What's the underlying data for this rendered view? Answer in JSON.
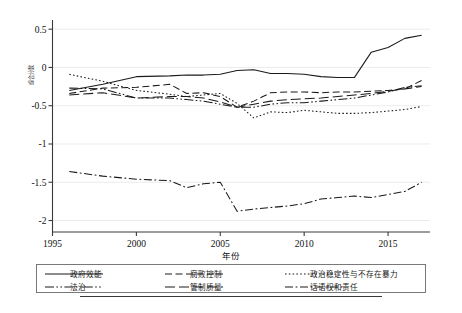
{
  "chart_data": {
    "type": "line",
    "title": "",
    "xlabel": "年份",
    "ylabel": "综合分数",
    "xlim": [
      1995,
      2017.5
    ],
    "ylim": [
      -2.15,
      0.62
    ],
    "grid": true,
    "legend_position": "bottom",
    "xticks": [
      1995,
      2000,
      2005,
      2010,
      2015
    ],
    "xticklabels": [
      "1995",
      "2000",
      "2005",
      "2010",
      "2015"
    ],
    "yticks": [
      0.5,
      0,
      -0.5,
      -1,
      -1.5,
      -2
    ],
    "yticklabels": [
      "0.5",
      "0",
      "-0.5",
      "-1",
      "-1.5",
      "-2"
    ],
    "x": [
      1996,
      1998,
      2000,
      2002,
      2003,
      2004,
      2005,
      2006,
      2007,
      2008,
      2009,
      2010,
      2011,
      2012,
      2013,
      2014,
      2015,
      2016,
      2017
    ],
    "series": [
      {
        "name": "政府效能",
        "dash": "solid",
        "values": [
          -0.3,
          -0.22,
          -0.12,
          -0.11,
          -0.1,
          -0.1,
          -0.09,
          -0.04,
          -0.03,
          -0.08,
          -0.08,
          -0.09,
          -0.12,
          -0.13,
          -0.13,
          0.2,
          0.26,
          0.38,
          0.42
        ]
      },
      {
        "name": "腐败控制",
        "dash": "dashed",
        "values": [
          -0.34,
          -0.27,
          -0.26,
          -0.22,
          -0.34,
          -0.33,
          -0.38,
          -0.52,
          -0.44,
          -0.33,
          -0.32,
          -0.32,
          -0.33,
          -0.32,
          -0.32,
          -0.31,
          -0.3,
          -0.28,
          -0.17
        ]
      },
      {
        "name": "政治稳定性与不存在暴力",
        "dash": "dotted",
        "values": [
          -0.09,
          -0.18,
          -0.3,
          -0.35,
          -0.38,
          -0.36,
          -0.34,
          -0.47,
          -0.66,
          -0.58,
          -0.59,
          -0.56,
          -0.58,
          -0.6,
          -0.6,
          -0.59,
          -0.57,
          -0.55,
          -0.51
        ]
      },
      {
        "name": "法治",
        "dash": "dashdotdot",
        "values": [
          -0.27,
          -0.28,
          -0.4,
          -0.4,
          -0.42,
          -0.44,
          -0.48,
          -0.52,
          -0.52,
          -0.48,
          -0.46,
          -0.46,
          -0.44,
          -0.42,
          -0.4,
          -0.36,
          -0.32,
          -0.26,
          -0.24
        ]
      },
      {
        "name": "管制质量",
        "dash": "longdash",
        "values": [
          -0.36,
          -0.33,
          -0.4,
          -0.38,
          -0.38,
          -0.4,
          -0.45,
          -0.52,
          -0.48,
          -0.44,
          -0.42,
          -0.41,
          -0.4,
          -0.38,
          -0.36,
          -0.34,
          -0.31,
          -0.28,
          -0.25
        ]
      },
      {
        "name": "话语权和责任",
        "dash": "dashdot",
        "values": [
          -1.36,
          -1.42,
          -1.46,
          -1.48,
          -1.57,
          -1.52,
          -1.5,
          -1.88,
          -1.85,
          -1.83,
          -1.81,
          -1.78,
          -1.72,
          -1.7,
          -1.68,
          -1.7,
          -1.66,
          -1.62,
          -1.5
        ]
      }
    ]
  },
  "legend": {
    "entries": [
      {
        "label": "政府效能"
      },
      {
        "label": "腐败控制"
      },
      {
        "label": "政治稳定性与不存在暴力"
      },
      {
        "label": "法治"
      },
      {
        "label": "管制质量"
      },
      {
        "label": "话语权和责任"
      }
    ]
  }
}
